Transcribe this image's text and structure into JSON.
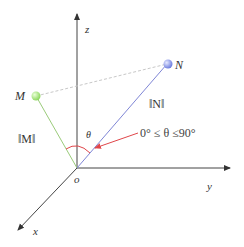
{
  "diagram": {
    "type": "3d-vector-angle",
    "axes": {
      "z": {
        "label": "z"
      },
      "y": {
        "label": "y"
      },
      "x": {
        "label": "x"
      },
      "origin": {
        "label": "o"
      }
    },
    "points": {
      "M": {
        "label": "M",
        "color": "#9be36a"
      },
      "N": {
        "label": "N",
        "color": "#7f8fe8"
      }
    },
    "vectors": {
      "OM": {
        "label": "‖M‖",
        "color": "#9acb7a"
      },
      "ON": {
        "label": "‖N‖",
        "color": "#7f86d6"
      }
    },
    "angle": {
      "symbol": "θ",
      "color": "#e0464a",
      "range_label": "0° ≤ θ ≤90°"
    },
    "colors": {
      "axis": "#333333",
      "dashed_link": "#c8c8c8",
      "annotation_red": "#e0464a"
    }
  }
}
